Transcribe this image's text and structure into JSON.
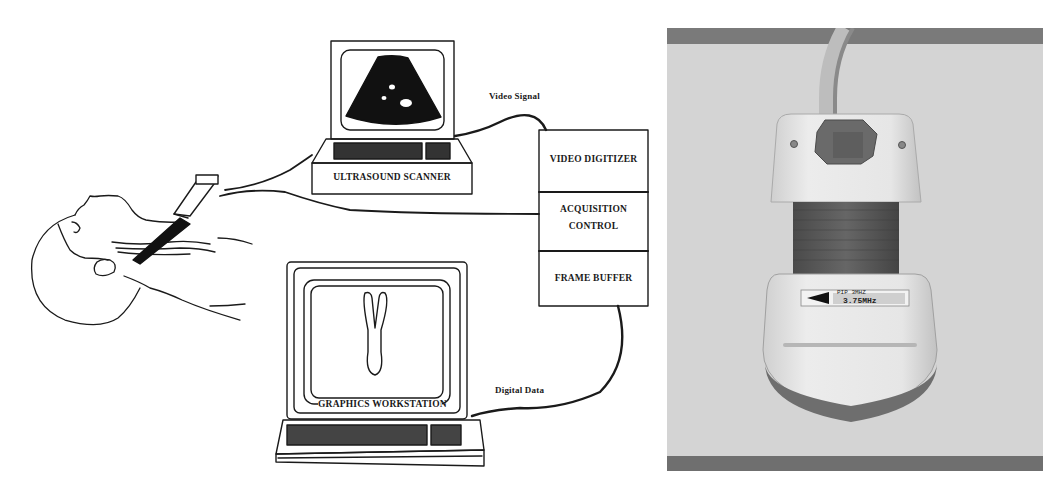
{
  "figure": {
    "left_panel": {
      "type": "schematic diagram",
      "components": {
        "ultrasound_scanner": "ULTRASOUND SCANNER",
        "video_digitizer": "VIDEO DIGITIZER",
        "acquisition_control_line1": "ACQUISITION",
        "acquisition_control_line2": "CONTROL",
        "frame_buffer": "FRAME BUFFER",
        "graphics_workstation": "GRAPHICS WORKSTATION"
      },
      "connections": {
        "video_signal": "Video Signal",
        "digital_data": "Digital Data"
      },
      "scanner_screen": "sector ultrasound image",
      "workstation_screen": "3D carotid bifurcation rendering",
      "patient": "supine patient with transducer on neck"
    },
    "right_panel": {
      "type": "photograph",
      "subject": "ultrasound transducer probe with position sensor mount",
      "probe_label_line1": "PIP 3MHZ",
      "probe_label_line2": "3.75MHz"
    }
  },
  "colors": {
    "ink": "#1a1a1a",
    "paper": "#ffffff",
    "photo_bg": "#d4d4d4",
    "photo_band": "#7a7a7a",
    "probe_body": "#e8e8e8",
    "probe_grip": "#555555",
    "sensor": "#6a6a6a"
  }
}
